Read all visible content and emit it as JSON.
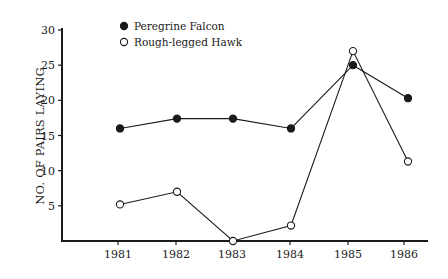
{
  "chart_data": {
    "type": "line",
    "title": "",
    "xlabel": "",
    "ylabel": "NO. OF PAIRS LAYING",
    "categories": [
      "1981",
      "1982",
      "1983",
      "1984",
      "1985",
      "1986"
    ],
    "yticks": [
      "5",
      "10",
      "15",
      "20",
      "25",
      "30"
    ],
    "ylim": [
      0,
      30
    ],
    "grid": false,
    "legend_position": "top-left",
    "series": [
      {
        "name": "Peregrine Falcon",
        "marker": "filled-circle",
        "color": "#1a1a1a",
        "values": [
          16,
          17.4,
          17.4,
          16,
          25,
          20.3
        ]
      },
      {
        "name": "Rough-legged Hawk",
        "marker": "open-circle",
        "color": "#1a1a1a",
        "values": [
          5.2,
          7,
          0,
          2.2,
          27,
          11.3
        ]
      }
    ]
  }
}
